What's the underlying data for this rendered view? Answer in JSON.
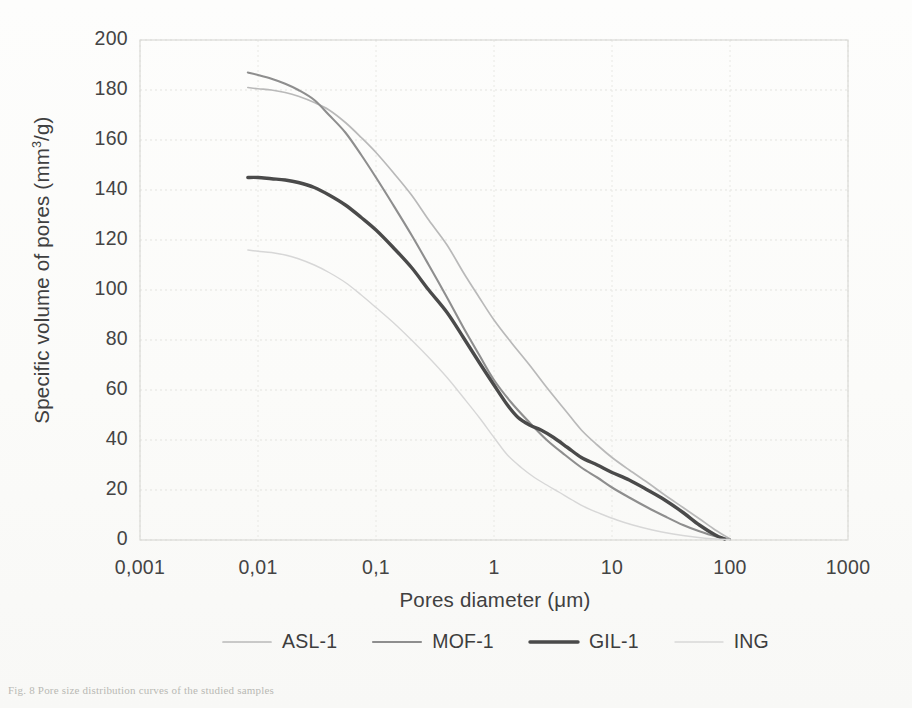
{
  "figure": {
    "caption_fragment": "Fig. 8  Pore size distribution curves of the studied samples"
  },
  "axes": {
    "y_title": "Specific volume of pores (mm",
    "y_title_sup": "3",
    "y_title_tail": "/g)",
    "x_title": "Pores diameter (μm)",
    "y_ticks": [
      "200",
      "180",
      "160",
      "140",
      "120",
      "100",
      "80",
      "60",
      "40",
      "20",
      "0"
    ],
    "x_ticks": [
      "0,001",
      "0,01",
      "0,1",
      "1",
      "10",
      "100",
      "1000"
    ]
  },
  "legend": {
    "items": [
      {
        "label": "ASL-1",
        "color": "#b9b9b9",
        "width": 1.7,
        "dash": "none"
      },
      {
        "label": "MOF-1",
        "color": "#8e8e8e",
        "width": 2.1,
        "dash": "none"
      },
      {
        "label": "GIL-1",
        "color": "#4a4a4a",
        "width": 3.4,
        "dash": "none"
      },
      {
        "label": "ING",
        "color": "#d7d7d7",
        "width": 1.4,
        "dash": "none"
      }
    ]
  },
  "chart_data": {
    "type": "line",
    "title": "",
    "xlabel": "Pores diameter (μm)",
    "ylabel": "Specific volume of pores (mm3/g)",
    "xscale": "log",
    "yscale": "linear",
    "xlim": [
      0.001,
      1000
    ],
    "ylim": [
      0,
      200
    ],
    "ytick_step": 20,
    "grid": true,
    "legend_position": "bottom",
    "series": [
      {
        "name": "ASL-1",
        "color": "#b9b9b9",
        "x": [
          0.0082,
          0.01,
          0.013,
          0.017,
          0.022,
          0.03,
          0.04,
          0.055,
          0.075,
          0.1,
          0.14,
          0.2,
          0.28,
          0.4,
          0.55,
          0.75,
          1.0,
          1.4,
          2.0,
          2.8,
          4.0,
          5.5,
          7.5,
          10,
          14,
          20,
          28,
          40,
          55,
          75,
          100
        ],
        "y": [
          181,
          180.5,
          180,
          179,
          177.5,
          175,
          172,
          167,
          161,
          155,
          147,
          138,
          128,
          118,
          107,
          97,
          88,
          79,
          70,
          61,
          52,
          44,
          38,
          33,
          28,
          23,
          18,
          13,
          8.5,
          4,
          0.5
        ]
      },
      {
        "name": "MOF-1",
        "color": "#8e8e8e",
        "x": [
          0.0082,
          0.01,
          0.013,
          0.017,
          0.022,
          0.03,
          0.04,
          0.055,
          0.075,
          0.1,
          0.14,
          0.2,
          0.28,
          0.4,
          0.55,
          0.75,
          1.0,
          1.4,
          2.0,
          2.8,
          4.0,
          5.5,
          7.5,
          10,
          14,
          20,
          28,
          40,
          55,
          75,
          100
        ],
        "y": [
          187,
          186,
          184.5,
          182.5,
          180,
          176,
          170,
          163,
          154,
          145,
          134,
          122,
          110,
          97,
          85,
          74,
          64,
          55,
          47,
          40,
          34,
          29,
          25,
          21,
          17,
          13,
          9.5,
          6,
          3.5,
          1.5,
          0.3
        ]
      },
      {
        "name": "GIL-1",
        "color": "#4a4a4a",
        "x": [
          0.0082,
          0.01,
          0.013,
          0.017,
          0.022,
          0.03,
          0.04,
          0.055,
          0.075,
          0.1,
          0.14,
          0.2,
          0.28,
          0.4,
          0.55,
          0.75,
          1.0,
          1.3,
          1.6,
          2.0,
          2.5,
          3.2,
          4.2,
          5.5,
          7.5,
          10,
          14,
          20,
          28,
          40,
          55,
          75,
          90
        ],
        "y": [
          145,
          145,
          144.5,
          144,
          143,
          141,
          138,
          134,
          129,
          124,
          117,
          109,
          100,
          91,
          81,
          71,
          62,
          54,
          49,
          46,
          44,
          41,
          37,
          33,
          30,
          27,
          24,
          20,
          16,
          11,
          6,
          2,
          0.4
        ]
      },
      {
        "name": "ING",
        "color": "#d7d7d7",
        "x": [
          0.0082,
          0.01,
          0.013,
          0.017,
          0.022,
          0.03,
          0.04,
          0.055,
          0.075,
          0.1,
          0.14,
          0.2,
          0.28,
          0.4,
          0.55,
          0.75,
          1.0,
          1.3,
          1.7,
          2.2,
          2.8,
          3.6,
          4.6,
          6.0,
          8.0,
          11,
          15,
          22,
          32,
          50,
          75,
          100
        ],
        "y": [
          116,
          115.5,
          115,
          114,
          112.5,
          110,
          107,
          103,
          98,
          93,
          87,
          80,
          73,
          65,
          57,
          49,
          41,
          34,
          29,
          25,
          22,
          19,
          16,
          13,
          10.5,
          8,
          6,
          4,
          2.5,
          1.2,
          0.4,
          0.2
        ]
      }
    ]
  }
}
